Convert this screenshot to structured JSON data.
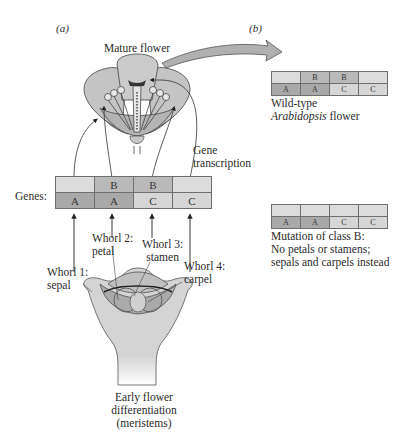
{
  "panel_a": {
    "label": "(a)",
    "mature_flower_label": "Mature flower",
    "gene_transcription_label": [
      "Gene",
      "transcription"
    ],
    "genes_label": "Genes:",
    "gene_table": {
      "top_row": [
        "",
        "B",
        "B",
        ""
      ],
      "bottom_row": [
        "A",
        "A",
        "C",
        "C"
      ]
    },
    "whorls": [
      {
        "name": "Whorl 1:",
        "organ": "sepal"
      },
      {
        "name": "Whorl 2:",
        "organ": "petal"
      },
      {
        "name": "Whorl 3:",
        "organ": "stamen"
      },
      {
        "name": "Whorl 4:",
        "organ": "carpel"
      }
    ],
    "meristem_caption": [
      "Early flower",
      "differentiation",
      "(meristems)"
    ]
  },
  "panel_b": {
    "label": "(b)",
    "wild_type": {
      "table": {
        "top_row": [
          "",
          "B",
          "B",
          ""
        ],
        "bottom_row": [
          "A",
          "A",
          "C",
          "C"
        ]
      },
      "caption_line1": "Wild-type",
      "caption_line2_italic": "Arabidopsis",
      "caption_line2_rest": " flower"
    },
    "mutant": {
      "table": {
        "top_row": [
          "",
          "",
          "",
          ""
        ],
        "bottom_row": [
          "A",
          "A",
          "C",
          "C"
        ]
      },
      "caption": [
        "Mutation of class B:",
        "No petals or stamens;",
        "sepals and carpels instead"
      ]
    }
  },
  "colors": {
    "gene_A": "#a9a9a9",
    "gene_B": "#b9b9b9",
    "gene_C": "#d6d6d6",
    "empty": "#dcdcdc",
    "flower_fill": "#bdbdbd",
    "meristem_fill": "#d4d4d4"
  }
}
